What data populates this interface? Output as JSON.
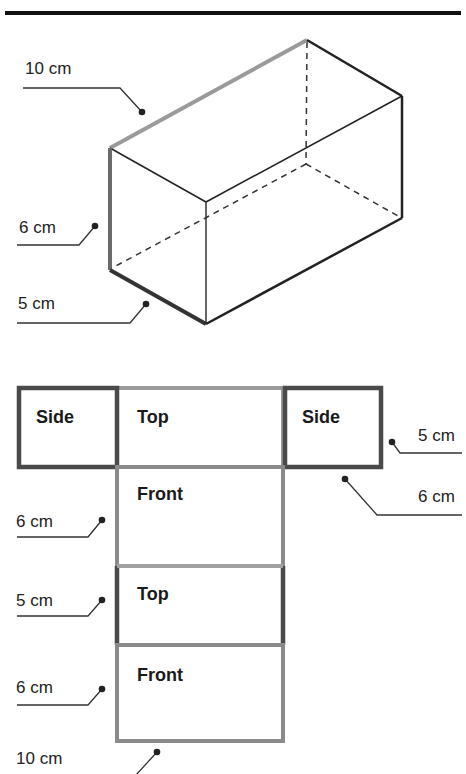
{
  "diagram": {
    "type": "rectangular prism and its net",
    "colors": {
      "title_rule": "#111111",
      "edge_dark": "#2a2a2a",
      "edge_gray": "#9a9a9a",
      "edge_mid": "#5a5a5a",
      "hidden_edge": "#333333",
      "label_text": "#222222"
    },
    "prism": {
      "dimensions": {
        "length": "10 cm",
        "height": "6 cm",
        "width": "5 cm"
      },
      "labels": [
        {
          "id": "length",
          "text": "10 cm"
        },
        {
          "id": "height",
          "text": "6 cm"
        },
        {
          "id": "width",
          "text": "5 cm"
        }
      ]
    },
    "net": {
      "faces": [
        {
          "id": "side-left",
          "text": "Side"
        },
        {
          "id": "top-1",
          "text": "Top"
        },
        {
          "id": "side-right",
          "text": "Side"
        },
        {
          "id": "front-1",
          "text": "Front"
        },
        {
          "id": "top-2",
          "text": "Top"
        },
        {
          "id": "front-2",
          "text": "Front"
        }
      ],
      "labels": [
        {
          "id": "side-width",
          "text": "5 cm"
        },
        {
          "id": "side-height",
          "text": "6 cm"
        },
        {
          "id": "front1-height",
          "text": "6 cm"
        },
        {
          "id": "top2-width",
          "text": "5 cm"
        },
        {
          "id": "front2-height",
          "text": "6 cm"
        },
        {
          "id": "bottom-length",
          "text": "10 cm"
        }
      ]
    }
  }
}
